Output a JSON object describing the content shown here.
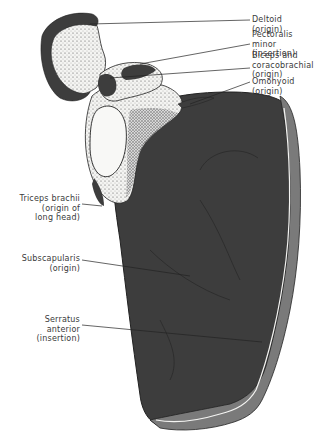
{
  "figure": {
    "colors": {
      "muscle_fill": "#3d3d3d",
      "bone_fill": "#f4f4f2",
      "stipple": "#555555",
      "line": "#222222",
      "label_text": "#3a3a3a",
      "rim_gray": "#7a7a7a"
    }
  },
  "labels": {
    "deltoid": "Deltoid (origin)",
    "pectoralis_minor": "Pectoralis minor\n(insertion)",
    "biceps": "Biceps and\ncoracobrachialis\n(origin)",
    "omohyoid": "Omohyoid (origin)",
    "triceps": "Triceps brachii\n(origin of\nlong head)",
    "subscapularis": "Subscapularis\n(origin)",
    "serratus": "Serratus\nanterior\n(insertion)"
  }
}
